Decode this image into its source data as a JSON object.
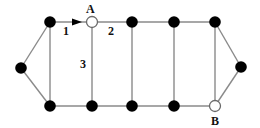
{
  "diagram": {
    "type": "graph",
    "nodes": [
      {
        "id": "L",
        "x": 21,
        "y": 68,
        "style": "filled"
      },
      {
        "id": "T1",
        "x": 50,
        "y": 22,
        "style": "filled"
      },
      {
        "id": "A",
        "x": 92,
        "y": 22,
        "style": "hollow",
        "label": "A"
      },
      {
        "id": "T3",
        "x": 132,
        "y": 22,
        "style": "filled"
      },
      {
        "id": "T4",
        "x": 174,
        "y": 22,
        "style": "filled"
      },
      {
        "id": "T5",
        "x": 215,
        "y": 22,
        "style": "filled"
      },
      {
        "id": "R",
        "x": 241,
        "y": 67,
        "style": "filled"
      },
      {
        "id": "B1",
        "x": 50,
        "y": 106,
        "style": "filled"
      },
      {
        "id": "B2",
        "x": 92,
        "y": 106,
        "style": "filled"
      },
      {
        "id": "B3",
        "x": 132,
        "y": 106,
        "style": "filled"
      },
      {
        "id": "B4",
        "x": 174,
        "y": 106,
        "style": "filled"
      },
      {
        "id": "B",
        "x": 215,
        "y": 106,
        "style": "hollow",
        "label": "B"
      }
    ],
    "edges": [
      {
        "from": "L",
        "to": "T1"
      },
      {
        "from": "L",
        "to": "B1"
      },
      {
        "from": "T1",
        "to": "A",
        "label": "1",
        "directed": true
      },
      {
        "from": "A",
        "to": "T3",
        "label": "2"
      },
      {
        "from": "T3",
        "to": "T4"
      },
      {
        "from": "T4",
        "to": "T5"
      },
      {
        "from": "T5",
        "to": "R"
      },
      {
        "from": "B1",
        "to": "B2"
      },
      {
        "from": "B2",
        "to": "B3"
      },
      {
        "from": "B3",
        "to": "B4"
      },
      {
        "from": "B4",
        "to": "B"
      },
      {
        "from": "B",
        "to": "R"
      },
      {
        "from": "T1",
        "to": "B1"
      },
      {
        "from": "A",
        "to": "B2",
        "label": "3"
      },
      {
        "from": "T3",
        "to": "B3"
      },
      {
        "from": "T4",
        "to": "B4"
      },
      {
        "from": "T5",
        "to": "B"
      }
    ],
    "labels": {
      "node_a": "A",
      "node_b": "B",
      "edge_1": "1",
      "edge_2": "2",
      "edge_3": "3"
    },
    "colors": {
      "edge": "#8a8a8a",
      "node_filled": "#000000",
      "node_hollow_fill": "#ffffff",
      "label": "#111111"
    }
  }
}
